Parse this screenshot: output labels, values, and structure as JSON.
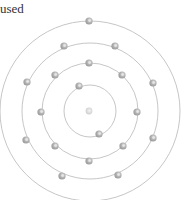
{
  "caption": "used",
  "colors": {
    "ring": "#b8b8b8",
    "electron": "#a9a9a9",
    "electron_highlight": "#e6e6e6",
    "nucleus": "#d2d2d2",
    "text": "#333333"
  },
  "atom": {
    "center": [
      90,
      111
    ],
    "shells": [
      {
        "radius": 26,
        "electrons": [
          [
            79,
            86
          ],
          [
            99,
            134
          ]
        ]
      },
      {
        "radius": 48,
        "electrons": [
          [
            89,
            63
          ],
          [
            55,
            75
          ],
          [
            122,
            75
          ],
          [
            41,
            112
          ],
          [
            137,
            112
          ],
          [
            55,
            146
          ],
          [
            123,
            146
          ],
          [
            89,
            161
          ]
        ]
      },
      {
        "radius": 68,
        "electrons": [
          [
            64,
            46
          ],
          [
            115,
            46
          ],
          [
            27,
            82
          ],
          [
            153,
            83
          ],
          [
            26,
            140
          ],
          [
            153,
            138
          ],
          [
            62,
            176
          ],
          [
            118,
            175
          ]
        ]
      },
      {
        "radius": 90,
        "electrons": [
          [
            89,
            21
          ]
        ]
      }
    ]
  }
}
